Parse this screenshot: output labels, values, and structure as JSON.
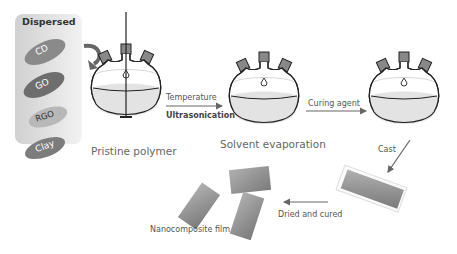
{
  "panel": {
    "title": "Dispersed",
    "fillers": [
      {
        "label": "CD",
        "color": "#8a8a8a"
      },
      {
        "label": "GO",
        "color": "#6e6e6e"
      },
      {
        "label": "RGO",
        "color": "#b8b8b8"
      },
      {
        "label": "Clay",
        "color": "#7c7c7c"
      }
    ]
  },
  "stages": {
    "stage1": "Pristine polymer",
    "stage2": "Solvent evaporation",
    "stage3_arrow": "Cast",
    "stage4_arrow": "Dried and cured",
    "final": "Nanocomposite film"
  },
  "arrows": {
    "arrow1_top": "Temperature",
    "arrow1_bottom": "Ultrasonication",
    "arrow2_top": "Curing agent"
  }
}
